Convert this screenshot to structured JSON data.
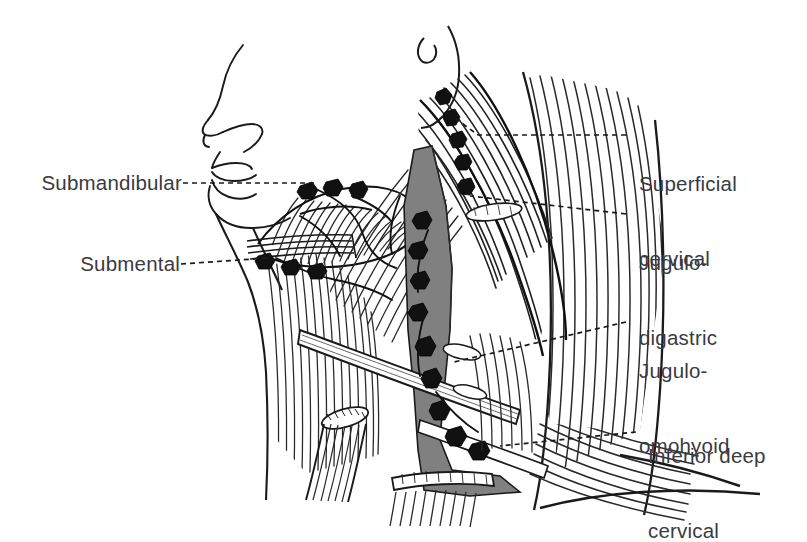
{
  "figure": {
    "type": "anatomical-illustration",
    "style": "pen-and-ink line engraving with hatching and gray tonal shading",
    "background_color": "#ffffff",
    "ink_color": "#1a1a1a",
    "text_color": "#3a3a42",
    "vessel_gray": "#808080",
    "node_dark": "#111111",
    "leader_style": "dashed"
  },
  "labels": {
    "left": [
      {
        "id": "submandibular",
        "text": "Submandibular",
        "lines": [
          "Submandibular"
        ]
      },
      {
        "id": "submental",
        "text": "Submental",
        "lines": [
          "Submental"
        ]
      }
    ],
    "right": [
      {
        "id": "superficial-cervical",
        "text": "Superficial cervical",
        "lines": [
          "Superficial",
          "cervical"
        ]
      },
      {
        "id": "jugulo-digastric",
        "text": "Jugulo-digastric",
        "lines": [
          "Jugulo-",
          "digastric"
        ]
      },
      {
        "id": "jugulo-omohyoid",
        "text": "Jugulo-omohyoid",
        "lines": [
          "Jugulo-",
          "omohyoid"
        ]
      },
      {
        "id": "inferior-deep-cervical",
        "text": "Inferior deep cervical",
        "lines": [
          "Inferior deep",
          "cervical"
        ]
      }
    ]
  },
  "structures": [
    {
      "name": "facial-profile",
      "description": "nose, lips and chin drawn in simple outline"
    },
    {
      "name": "mandible-border",
      "description": "lower jaw margin"
    },
    {
      "name": "ear-lobe",
      "description": "ear lobule at upper right of face"
    },
    {
      "name": "sternocleidomastoid",
      "description": "large hatched strap muscle crossing the neck"
    },
    {
      "name": "trapezius",
      "description": "fanned hatching of the posterior neck and shoulder"
    },
    {
      "name": "omohyoid",
      "description": "pale ribbon muscle crossing the lower neck obliquely"
    },
    {
      "name": "internal-jugular-vein",
      "description": "gray shaded vertical vessel"
    },
    {
      "name": "submandibular-gland",
      "description": "hatched gland beneath the jaw"
    },
    {
      "name": "lymph-node-chain",
      "description": "dark irregular nodes along the jugular and jaw"
    },
    {
      "name": "clavicle",
      "description": "cut bone end at the base of the neck"
    },
    {
      "name": "shoulder-contour",
      "description": "lower outline of the shoulder"
    }
  ]
}
